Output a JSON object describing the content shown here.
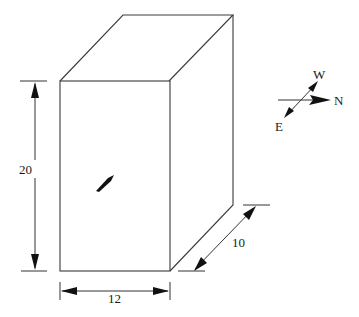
{
  "diagram": {
    "type": "rectangular-box-isometric",
    "dimensions": {
      "height_label": "20",
      "width_label": "12",
      "depth_label": "10"
    },
    "compass": {
      "north_label": "N",
      "west_label": "W",
      "east_label": "E"
    },
    "colors": {
      "line": "#3a3a3a",
      "arrow": "#111111",
      "background": "#ffffff"
    }
  }
}
